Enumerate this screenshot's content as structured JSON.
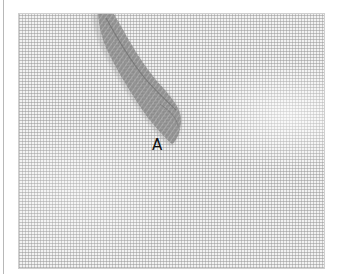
{
  "figure": {
    "labels": [
      {
        "id": "A",
        "text": "A"
      }
    ],
    "colors": {
      "fabric": "#f2f2f2",
      "weave": "#969696",
      "thread": "#8a8a8a",
      "label": "#111111"
    }
  }
}
